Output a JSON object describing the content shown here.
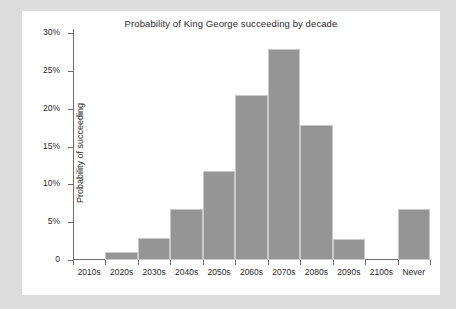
{
  "chart_data": {
    "type": "bar",
    "title": "Probability of King George succeeding by decade",
    "xlabel": "",
    "ylabel": "Probability of succeeding",
    "categories": [
      "2010s",
      "2020s",
      "2030s",
      "2040s",
      "2050s",
      "2060s",
      "2070s",
      "2080s",
      "2090s",
      "2100s",
      "Never"
    ],
    "values": [
      0,
      1.0,
      2.9,
      6.8,
      11.8,
      21.8,
      27.9,
      17.8,
      2.8,
      0,
      6.7
    ],
    "ytick_labels": [
      "30%",
      "25%",
      "20%",
      "15%",
      "10%",
      "5%",
      "0"
    ],
    "ytick_values": [
      30,
      25,
      20,
      15,
      10,
      5,
      0
    ],
    "ylim": [
      0,
      30
    ],
    "grid": false,
    "legend": false,
    "bar_color": "#959595",
    "axis_color": "#6e6e6e",
    "plot_background": "#ffffff",
    "page_background": "#dcdcdc"
  }
}
